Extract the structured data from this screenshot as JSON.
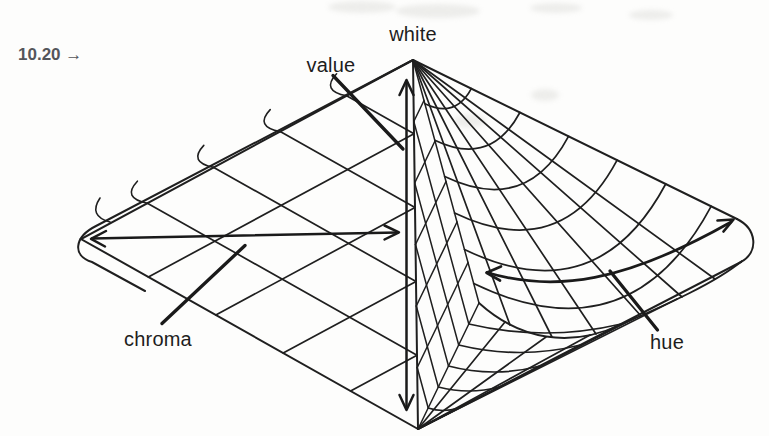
{
  "figure_label": {
    "full": "10.20 →",
    "number": "10.20",
    "arrow_glyph": "→"
  },
  "labels": {
    "white": "white",
    "value": "value",
    "chroma": "chroma",
    "hue": "hue"
  },
  "diagram": {
    "type": "color-solid-bicone-wireframe",
    "annotations": [
      {
        "label": "white",
        "points_to": "top-apex"
      },
      {
        "label": "value",
        "points_to": "vertical-double-arrow-axis"
      },
      {
        "label": "chroma",
        "points_to": "horizontal-double-arrow-radius"
      },
      {
        "label": "hue",
        "points_to": "curved-double-arrow-around-cone"
      }
    ]
  },
  "colors": {
    "ink": "#1f1f1f",
    "caption_gray": "#54555a",
    "paper": "#fdfdfc"
  }
}
